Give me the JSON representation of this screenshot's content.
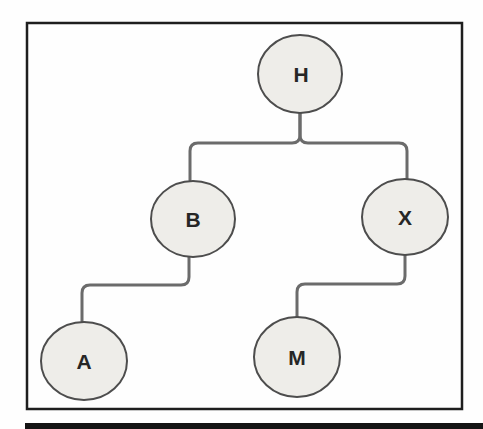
{
  "figure": {
    "type": "tree-diagram",
    "nodes": [
      {
        "id": "H",
        "label": "H",
        "parent": null
      },
      {
        "id": "B",
        "label": "B",
        "parent": "H"
      },
      {
        "id": "X",
        "label": "X",
        "parent": "H"
      },
      {
        "id": "A",
        "label": "A",
        "parent": "B"
      },
      {
        "id": "M",
        "label": "M",
        "parent": "X"
      }
    ],
    "edges": [
      {
        "from": "H",
        "to": "B"
      },
      {
        "from": "H",
        "to": "X"
      },
      {
        "from": "B",
        "to": "A"
      },
      {
        "from": "X",
        "to": "M"
      }
    ],
    "colors": {
      "background": "#fefefe",
      "node_fill": "#eeede9",
      "node_border": "#4d4d4d",
      "edge": "#6b6b6b",
      "label": "#262626",
      "frame_border": "#1e1e1e",
      "bottom_bar": "#141414"
    }
  }
}
